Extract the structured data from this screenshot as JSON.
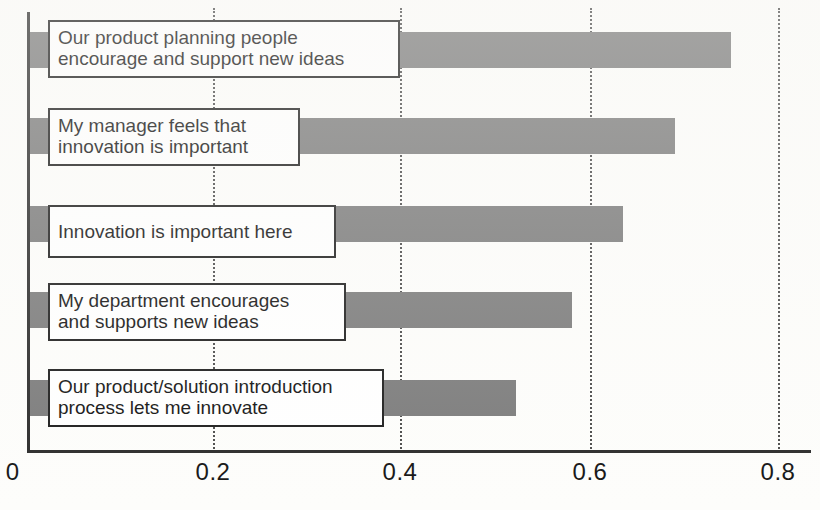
{
  "chart_data": {
    "type": "bar",
    "orientation": "horizontal",
    "title": "",
    "xlabel": "",
    "ylabel": "",
    "xlim": [
      0,
      0.8
    ],
    "grid": true,
    "legend": "none",
    "x_ticks": [
      "0",
      "0.2",
      "0.4",
      "0.6",
      "0.8"
    ],
    "x_tick_values": [
      0,
      0.2,
      0.4,
      0.6,
      0.8
    ],
    "categories": [
      "Our product planning people\nencourage and support new ideas",
      "My manager feels that\ninnovation is important",
      "Innovation is important here",
      "My department encourages\nand supports new ideas",
      "Our product/solution introduction\nprocess lets me innovate"
    ],
    "values": [
      0.75,
      0.69,
      0.635,
      0.58,
      0.52
    ],
    "bar_color": "#7b7b7b",
    "axis_color": "#2b2b2b",
    "gridline_color": "#4a4a4a",
    "label_box_fill": "#ffffff",
    "label_box_border": "#1c1c1c"
  }
}
